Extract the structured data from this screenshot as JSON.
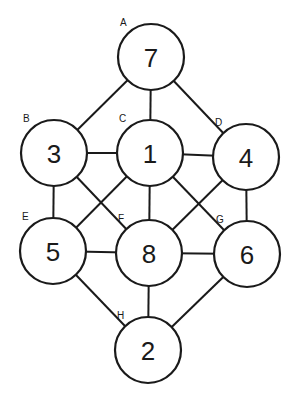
{
  "diagram": {
    "type": "graph",
    "nodes": [
      {
        "id": "A",
        "label": "A",
        "value": "7",
        "x": 151,
        "y": 57
      },
      {
        "id": "B",
        "label": "B",
        "value": "3",
        "x": 54,
        "y": 153
      },
      {
        "id": "C",
        "label": "C",
        "value": "1",
        "x": 150,
        "y": 153
      },
      {
        "id": "D",
        "label": "D",
        "value": "4",
        "x": 246,
        "y": 157
      },
      {
        "id": "E",
        "label": "E",
        "value": "5",
        "x": 53,
        "y": 251
      },
      {
        "id": "F",
        "label": "F",
        "value": "8",
        "x": 149,
        "y": 253
      },
      {
        "id": "G",
        "label": "G",
        "value": "6",
        "x": 247,
        "y": 254
      },
      {
        "id": "H",
        "label": "H",
        "value": "2",
        "x": 148,
        "y": 350
      }
    ],
    "edges": [
      [
        "A",
        "B"
      ],
      [
        "A",
        "C"
      ],
      [
        "A",
        "D"
      ],
      [
        "B",
        "C"
      ],
      [
        "C",
        "D"
      ],
      [
        "B",
        "E"
      ],
      [
        "B",
        "F"
      ],
      [
        "C",
        "E"
      ],
      [
        "C",
        "F"
      ],
      [
        "C",
        "G"
      ],
      [
        "D",
        "F"
      ],
      [
        "D",
        "G"
      ],
      [
        "E",
        "F"
      ],
      [
        "F",
        "G"
      ],
      [
        "E",
        "H"
      ],
      [
        "F",
        "H"
      ],
      [
        "G",
        "H"
      ]
    ],
    "radius": 33
  }
}
